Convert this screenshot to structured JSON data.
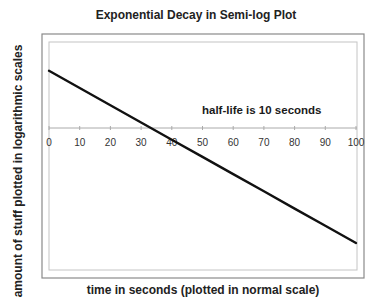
{
  "chart": {
    "title": "Exponential Decay in Semi-log Plot",
    "xlabel": "time in seconds (plotted in normal scale)",
    "ylabel": "amount of stuff plotted in logarithmic scales",
    "annotation": "half-life is 10 seconds",
    "x_ticks": [
      "0",
      "10",
      "20",
      "30",
      "40",
      "50",
      "60",
      "70",
      "80",
      "90",
      "100"
    ],
    "colors": {
      "line": "#111111",
      "frame": "#888888",
      "plot_border": "#bbbbbb",
      "axis": "#aaaaaa"
    }
  },
  "chart_data": {
    "type": "line",
    "title": "Exponential Decay in Semi-log Plot",
    "xlabel": "time in seconds (plotted in normal scale)",
    "ylabel": "amount of stuff plotted in logarithmic scales",
    "x": [
      0,
      10,
      20,
      30,
      40,
      50,
      60,
      70,
      80,
      90,
      100
    ],
    "series": [
      {
        "name": "amount",
        "values": [
          10,
          5,
          2.5,
          1.25,
          0.625,
          0.3125,
          0.15625,
          0.078125,
          0.0390625,
          0.01953125,
          0.009765625
        ]
      }
    ],
    "xlim": [
      0,
      100
    ],
    "yscale": "log",
    "ylim": [
      0.004,
      40
    ],
    "x_axis_crosses_y_at": 1,
    "y_tick_labels": [],
    "grid": false,
    "legend": null,
    "annotations": [
      {
        "text": "half-life is 10 seconds",
        "x": 50,
        "y": 2
      }
    ]
  }
}
